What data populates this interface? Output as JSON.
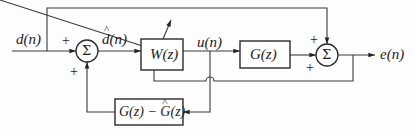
{
  "diagram": {
    "type": "block-diagram",
    "signals": {
      "input": "d(n)",
      "estimate": "d(n)",
      "estimate_hat": true,
      "control": "u(n)",
      "output": "e(n)"
    },
    "blocks": {
      "adaptive_filter": "W(z)",
      "plant": "G(z)",
      "model_error": {
        "prefix": "G(z) − ",
        "hat_part": "G",
        "suffix": "(z)"
      }
    },
    "summers": {
      "sum1": {
        "symbol": "Σ",
        "signs": [
          "+",
          "+"
        ]
      },
      "sum2": {
        "symbol": "Σ",
        "signs": [
          "+",
          "+"
        ]
      }
    }
  }
}
